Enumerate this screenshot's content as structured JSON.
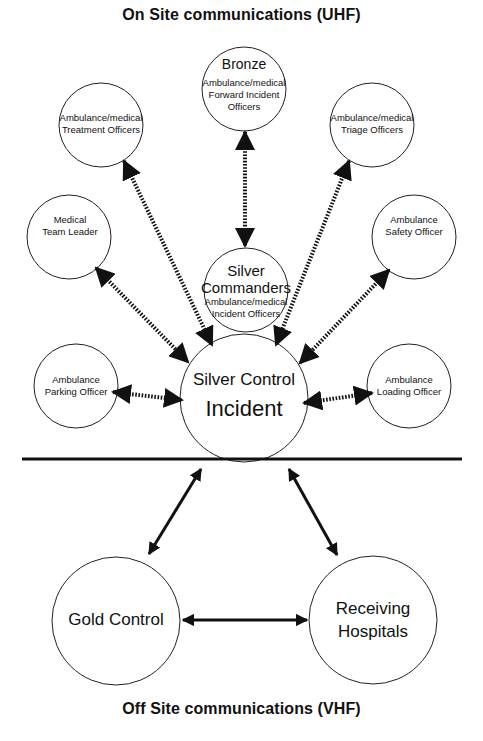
{
  "titles": {
    "top": "On Site communications (UHF)",
    "bottom": "Off Site communications (VHF)"
  },
  "nodes": {
    "bronze": {
      "heading": "Bronze",
      "lines": [
        "Ambulance/medical",
        "Forward Incident",
        "Officers"
      ]
    },
    "treatment": {
      "lines": [
        "Ambulance/medical",
        "Treatment Officers"
      ]
    },
    "triage": {
      "lines": [
        "Ambulance/medical",
        "Triage Officers"
      ]
    },
    "medical_team_leader": {
      "lines": [
        "Medical",
        "Team Leader"
      ]
    },
    "safety": {
      "lines": [
        "Ambulance",
        "Safety Officer"
      ]
    },
    "silver_commanders": {
      "heading_lines": [
        "Silver",
        "Commanders"
      ],
      "lines": [
        "Ambulance/medical",
        "Incident Officers"
      ]
    },
    "parking": {
      "lines": [
        "Ambulance",
        "Parking Officer"
      ]
    },
    "loading": {
      "lines": [
        "Ambulance",
        "Loading Officer"
      ]
    },
    "silver_control": {
      "line1": "Silver Control",
      "line2": "Incident"
    },
    "gold_control": {
      "label": "Gold Control"
    },
    "receiving_hospitals": {
      "lines": [
        "Receiving",
        "Hospitals"
      ]
    }
  },
  "connections": [
    {
      "from": "bronze",
      "to": "silver_commanders",
      "style": "dotted",
      "bidirectional": true
    },
    {
      "from": "treatment",
      "to": "silver_control",
      "style": "dotted",
      "bidirectional": true
    },
    {
      "from": "triage",
      "to": "silver_control",
      "style": "dotted",
      "bidirectional": true
    },
    {
      "from": "medical_team_leader",
      "to": "silver_control",
      "style": "dotted",
      "bidirectional": true
    },
    {
      "from": "safety",
      "to": "silver_control",
      "style": "dotted",
      "bidirectional": true
    },
    {
      "from": "parking",
      "to": "silver_control",
      "style": "dotted",
      "bidirectional": true
    },
    {
      "from": "loading",
      "to": "silver_control",
      "style": "dotted",
      "bidirectional": true
    },
    {
      "from": "silver_control",
      "to": "gold_control",
      "style": "solid",
      "bidirectional": true
    },
    {
      "from": "silver_control",
      "to": "receiving_hospitals",
      "style": "solid",
      "bidirectional": true
    },
    {
      "from": "gold_control",
      "to": "receiving_hospitals",
      "style": "solid",
      "bidirectional": true
    }
  ],
  "colors": {
    "ink": "#111111",
    "background": "#ffffff"
  }
}
